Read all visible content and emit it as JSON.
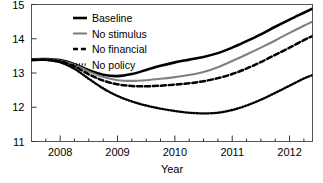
{
  "chart_data": {
    "type": "line",
    "title": "",
    "xlabel": "Year",
    "ylabel": "",
    "xlim": [
      2007.5,
      2012.4
    ],
    "ylim": [
      11,
      15
    ],
    "yticks": [
      11,
      12,
      13,
      14,
      15
    ],
    "ytick_labels": [
      "11",
      "12",
      "13",
      "14",
      "15"
    ],
    "xticks": [
      2008,
      2009,
      2010,
      2011,
      2012
    ],
    "xtick_labels": [
      "2008",
      "2009",
      "2010",
      "2011",
      "2012"
    ],
    "xminor_ticks": [
      2007.75,
      2008.25,
      2008.5,
      2008.75,
      2009.25,
      2009.5,
      2009.75,
      2010.25,
      2010.5,
      2010.75,
      2011.25,
      2011.5,
      2011.75,
      2012.25
    ],
    "grid": false,
    "legend_position": "upper-left-inside",
    "x": [
      2007.5,
      2007.75,
      2008.0,
      2008.25,
      2008.5,
      2008.75,
      2009.0,
      2009.25,
      2009.5,
      2009.75,
      2010.0,
      2010.25,
      2010.5,
      2010.75,
      2011.0,
      2011.25,
      2011.5,
      2011.75,
      2012.0,
      2012.25,
      2012.4
    ],
    "series": [
      {
        "name": "Baseline",
        "color": "#000000",
        "style": "solid",
        "width": 2.6,
        "values": [
          13.4,
          13.41,
          13.38,
          13.26,
          13.08,
          12.95,
          12.91,
          12.97,
          13.09,
          13.21,
          13.31,
          13.39,
          13.47,
          13.58,
          13.74,
          13.93,
          14.13,
          14.35,
          14.56,
          14.76,
          14.88
        ]
      },
      {
        "name": "No stimulus",
        "color": "#808080",
        "style": "solid",
        "width": 2.1,
        "values": [
          13.39,
          13.4,
          13.36,
          13.24,
          13.04,
          12.88,
          12.79,
          12.77,
          12.79,
          12.83,
          12.88,
          12.94,
          13.03,
          13.17,
          13.35,
          13.54,
          13.74,
          13.95,
          14.17,
          14.38,
          14.5
        ]
      },
      {
        "name": "No financial",
        "color": "#000000",
        "style": "dashed",
        "width": 2.5,
        "values": [
          13.38,
          13.39,
          13.34,
          13.19,
          12.96,
          12.78,
          12.67,
          12.62,
          12.61,
          12.63,
          12.66,
          12.7,
          12.76,
          12.85,
          12.97,
          13.13,
          13.32,
          13.53,
          13.74,
          13.96,
          14.08
        ]
      },
      {
        "name": "No policy",
        "color": "#000000",
        "style": "dotted",
        "width": 2.4,
        "values": [
          13.37,
          13.38,
          13.31,
          13.12,
          12.83,
          12.55,
          12.33,
          12.17,
          12.05,
          11.96,
          11.89,
          11.84,
          11.82,
          11.84,
          11.92,
          12.05,
          12.22,
          12.42,
          12.63,
          12.84,
          12.94
        ]
      }
    ]
  },
  "legend": {
    "items": [
      {
        "label": "Baseline"
      },
      {
        "label": "No stimulus"
      },
      {
        "label": "No financial"
      },
      {
        "label": "No policy"
      }
    ]
  }
}
